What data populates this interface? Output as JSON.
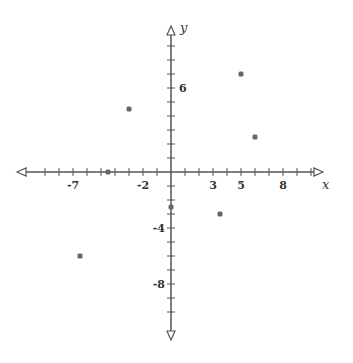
{
  "chart_data": {
    "type": "scatter",
    "title": "",
    "xlabel": "x",
    "ylabel": "y",
    "xlim": [
      -10,
      10
    ],
    "ylim": [
      -11,
      9
    ],
    "grid": false,
    "x_tick_labels": [
      "-7",
      "-2",
      "3",
      "5",
      "8"
    ],
    "x_tick_label_values": [
      -7,
      -2,
      3,
      5,
      8
    ],
    "y_tick_labels": [
      "6",
      "-4",
      "-8"
    ],
    "y_tick_label_values": [
      6,
      -4,
      -8
    ],
    "points": [
      {
        "x": 5,
        "y": 7
      },
      {
        "x": -3,
        "y": 4.5
      },
      {
        "x": 6,
        "y": 2.5
      },
      {
        "x": -4.5,
        "y": 0
      },
      {
        "x": 0,
        "y": -2.5
      },
      {
        "x": 3.5,
        "y": -3
      },
      {
        "x": -6.5,
        "y": -6
      }
    ]
  },
  "style": {
    "axis_color": "#555555",
    "point_color": "#666666",
    "origin_px": [
      171,
      172
    ],
    "unit_px": 14
  }
}
